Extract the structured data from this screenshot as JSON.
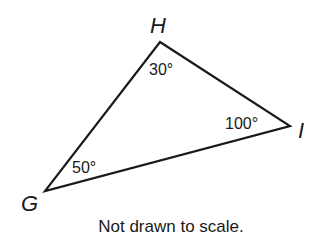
{
  "diagram": {
    "type": "triangle",
    "vertices": [
      {
        "name": "H",
        "angle": "30°"
      },
      {
        "name": "I",
        "angle": "100°"
      },
      {
        "name": "G",
        "angle": "50°"
      }
    ],
    "caption": "Not drawn to scale."
  }
}
